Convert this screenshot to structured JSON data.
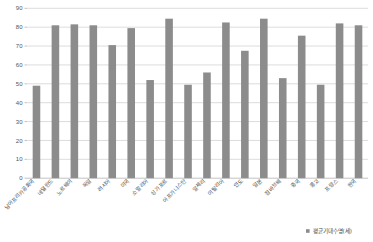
{
  "chart_data": {
    "type": "bar",
    "title": "",
    "xlabel": "",
    "ylabel": "",
    "ylim": [
      0,
      90
    ],
    "ytick_step": 10,
    "grid": true,
    "legend_position": "bottom-right",
    "bar_color": "#8c8c8c",
    "categories": [
      "남아프리카공화국",
      "네덜란드",
      "노르웨이",
      "독일",
      "러시아",
      "미국",
      "소말리아",
      "싱가포르",
      "아프가니스탄",
      "알제리",
      "이탈리아",
      "인도",
      "일본",
      "짐바브웨",
      "중국",
      "콩고",
      "프랑스",
      "한국"
    ],
    "values": [
      49,
      81,
      81.5,
      81,
      70.5,
      79.5,
      52,
      84.5,
      49.5,
      56,
      82.5,
      67.5,
      84.5,
      53,
      75.5,
      49.5,
      82,
      81
    ],
    "yticks": [
      0,
      10,
      20,
      30,
      40,
      50,
      60,
      70,
      80,
      90
    ],
    "ytick_labels": [
      "0",
      "10",
      "20",
      "30",
      "40",
      "50",
      "60",
      "70",
      "80",
      "90"
    ],
    "series": [
      {
        "name": "평균기대수명(세)",
        "values": [
          49,
          81,
          81.5,
          81,
          70.5,
          79.5,
          52,
          84.5,
          49.5,
          56,
          82.5,
          67.5,
          84.5,
          53,
          75.5,
          49.5,
          82,
          81
        ]
      }
    ]
  },
  "legend": {
    "entries": [
      {
        "label": "평균기대수명(세)",
        "color": "#8c8c8c"
      }
    ]
  }
}
